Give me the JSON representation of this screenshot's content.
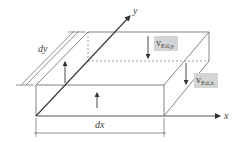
{
  "diagram": {
    "axes": {
      "x_label": "x",
      "y_label": "y"
    },
    "dimensions": {
      "dx_label": "dx",
      "dy_label": "dy"
    },
    "forces": [
      {
        "id": "v_ed_y",
        "symbol": "v",
        "subscript": "Ed,y"
      },
      {
        "id": "v_ed_x",
        "symbol": "v",
        "subscript": "Ed,x"
      }
    ],
    "colors": {
      "line": "#555555",
      "label_bg": "#d4d4d4",
      "text": "#444444"
    }
  }
}
